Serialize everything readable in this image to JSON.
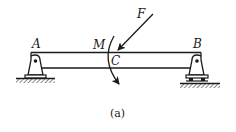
{
  "figure": {
    "caption": "(a)",
    "labels": {
      "support_left": "A",
      "support_right": "B",
      "moment": "M",
      "point": "C",
      "force": "F"
    }
  },
  "elements": {
    "beam": "simply supported beam A–B",
    "left_support": "pin support at A",
    "right_support": "roller support at B",
    "force": "inclined force F acting at C, directed down-left",
    "moment": "clockwise moment M applied at C"
  },
  "colors": {
    "stroke": "#1a1a1a",
    "background": "#ffffff"
  }
}
